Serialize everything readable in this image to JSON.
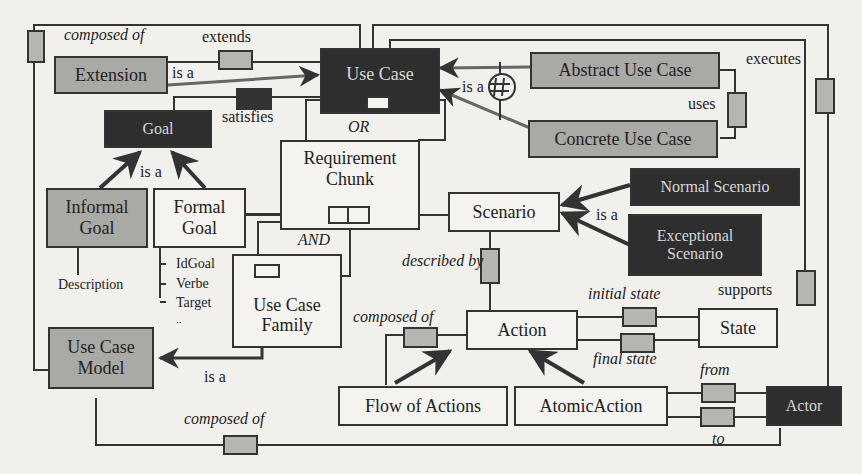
{
  "diagram": {
    "nodes": {
      "use_case": "Use Case",
      "extension": "Extension",
      "goal": "Goal",
      "abstract_use_case": "Abstract Use Case",
      "concrete_use_case": "Concrete Use Case",
      "requirement_chunk": "Requirement Chunk",
      "informal_goal": "Informal Goal",
      "formal_goal": "Formal Goal",
      "scenario": "Scenario",
      "normal_scenario": "Normal Scenario",
      "exceptional_scenario": "Exceptional Scenario",
      "use_case_family": "Use Case Family",
      "use_case_model": "Use Case Model",
      "action": "Action",
      "state": "State",
      "flow_of_actions": "Flow of Actions",
      "atomic_action": "AtomicAction",
      "actor": "Actor"
    },
    "attributes": {
      "informal_goal": [
        "Description"
      ],
      "formal_goal": [
        "IdGoal",
        "Verbe",
        "Target",
        ".."
      ]
    },
    "labels": {
      "composed_of_top": "composed of",
      "extends": "extends",
      "is_a_extension": "is a",
      "satisfies": "satisfies",
      "or": "OR",
      "is_a_use_case": "is a",
      "uses": "uses",
      "executes": "executes",
      "is_a_goal": "is a",
      "and": "AND",
      "is_a_scenario": "is a",
      "described_by": "described by",
      "initial_state": "initial state",
      "final_state": "final state",
      "supports": "supports",
      "composed_of_action": "composed of",
      "is_a_family": "is a",
      "from": "from",
      "to": "to",
      "composed_of_bottom": "composed of"
    }
  }
}
